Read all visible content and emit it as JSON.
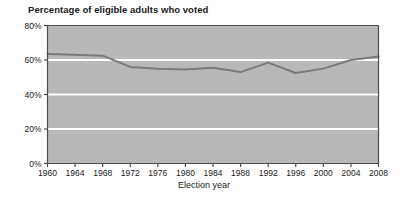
{
  "chart_data": {
    "type": "line",
    "title": "Percentage of eligible adults who voted",
    "xlabel": "Election year",
    "ylabel": "",
    "x": [
      1960,
      1964,
      1968,
      1972,
      1976,
      1980,
      1984,
      1988,
      1992,
      1996,
      2000,
      2004,
      2008
    ],
    "values": [
      63.5,
      63.0,
      62.5,
      56.0,
      55.0,
      54.5,
      55.5,
      53.0,
      58.5,
      52.5,
      55.0,
      60.0,
      62.0
    ],
    "series": [
      {
        "name": "Percentage of eligible adults who voted",
        "values": [
          63.5,
          63.0,
          62.5,
          56.0,
          55.0,
          54.5,
          55.5,
          53.0,
          58.5,
          52.5,
          55.0,
          60.0,
          62.0
        ]
      }
    ],
    "xlim": [
      1960,
      2008
    ],
    "ylim": [
      0,
      80
    ],
    "ytick_labels": [
      "0%",
      "20%",
      "40%",
      "60%",
      "80%"
    ],
    "ytick_values": [
      0,
      20,
      40,
      60,
      80
    ],
    "xtick_labels": [
      "1960",
      "1964",
      "1968",
      "1972",
      "1976",
      "1980",
      "1984",
      "1988",
      "1992",
      "1996",
      "2000",
      "2004",
      "2008"
    ],
    "grid": "horizontal-white-gridlines",
    "legend": "none",
    "plot_background_color": "#b8b8b8",
    "gridline_color": "#ffffff",
    "line_color": "#7a7a7a",
    "axis_color": "#555555",
    "text_color": "#1a1a1a"
  }
}
